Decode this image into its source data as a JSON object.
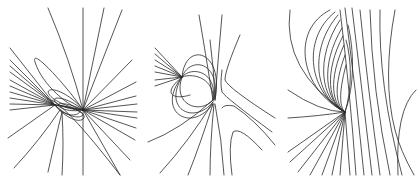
{
  "figure": {
    "line_color": "#2a2a2a",
    "background": "#ffffff",
    "panels": [
      {
        "id": "panel-1",
        "singular_points": [
          [
            55,
            105
          ],
          [
            83,
            110
          ]
        ],
        "features": [
          "radiating lines",
          "elliptic loops between points",
          "vertical line through right point"
        ]
      },
      {
        "id": "panel-2",
        "singular_points": [
          [
            182,
            77
          ],
          [
            213,
            100
          ]
        ],
        "features": [
          "dipole-like loops",
          "hyperbolic curves on right"
        ]
      },
      {
        "id": "panel-3",
        "singular_points": [
          [
            345,
            112
          ]
        ],
        "features": [
          "nested ellipses",
          "fan of lines below",
          "near-vertical curves on right"
        ]
      }
    ]
  }
}
